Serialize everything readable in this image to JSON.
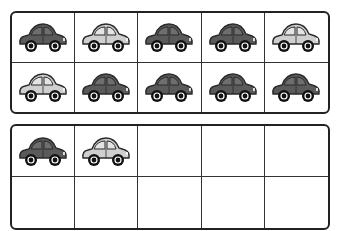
{
  "colors": {
    "dark_body": "#5a5a5a",
    "dark_window": "#6e6e6e",
    "light_body": "#cfcfcf",
    "light_window": "#e4e4e4",
    "outline": "#2a2a2a",
    "wheel": "#111111",
    "hub": "#ffffff",
    "frame_border": "#222222"
  },
  "ten_frames": [
    {
      "name": "top-ten-frame",
      "cells": [
        "dark",
        "light",
        "dark",
        "dark",
        "light",
        "light",
        "dark",
        "dark",
        "dark",
        "dark"
      ]
    },
    {
      "name": "bottom-ten-frame",
      "cells": [
        "dark",
        "light",
        "empty",
        "empty",
        "empty",
        "empty",
        "empty",
        "empty",
        "empty",
        "empty"
      ]
    }
  ],
  "counts": {
    "top_frame_cars": 10,
    "bottom_frame_cars": 2,
    "total_cars": 12
  }
}
